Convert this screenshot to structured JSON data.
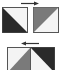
{
  "diagram": {
    "colors": {
      "dark": "#2a2a2a",
      "gray": "#7a7a7a",
      "light": "#f4f4f4",
      "border": "#555555",
      "arrow": "#333333"
    },
    "top_row": {
      "arrow_direction": "right",
      "left_square": {
        "split": "top-left to bottom-right",
        "upper": "light",
        "lower": "dark"
      },
      "right_square": {
        "split": "bottom-left to top-right",
        "upper": "gray",
        "lower": "light"
      }
    },
    "bottom_row": {
      "arrow_direction": "left",
      "left_square": {
        "split": "bottom-left to top-right",
        "upper": "light",
        "lower": "gray"
      },
      "right_square": {
        "split": "top-left to bottom-right",
        "upper": "dark",
        "lower": "light"
      }
    }
  }
}
